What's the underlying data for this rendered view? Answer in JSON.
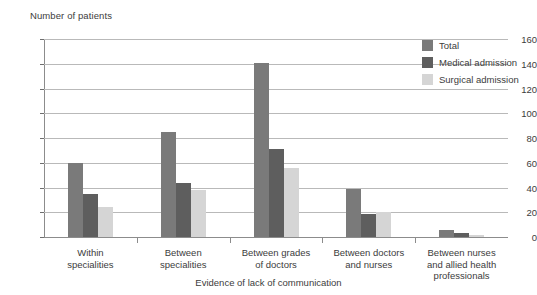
{
  "chart_data": {
    "type": "bar",
    "title": "Number of patients",
    "xlabel": "Evidence of lack of communication",
    "ylabel": "Number of patients",
    "ylim": [
      0,
      160
    ],
    "ytick_step": 20,
    "yticks": [
      0,
      20,
      40,
      60,
      80,
      100,
      120,
      140,
      160
    ],
    "grid": true,
    "legend_position": "top-right",
    "categories": [
      "Within specialities",
      "Between specialities",
      "Between grades of doctors",
      "Between doctors and nurses",
      "Between nurses and allied health professionals"
    ],
    "category_lines": [
      [
        "Within",
        "specialities"
      ],
      [
        "Between",
        "specialities"
      ],
      [
        "Between grades",
        "of doctors"
      ],
      [
        "Between doctors",
        "and nurses"
      ],
      [
        "Between nurses",
        "and allied health",
        "professionals"
      ]
    ],
    "series": [
      {
        "name": "Total",
        "color": "#7a7a7a",
        "values": [
          60,
          85,
          141,
          39,
          6
        ]
      },
      {
        "name": "Medical admission",
        "color": "#5e5e5e",
        "values": [
          35,
          44,
          71,
          19,
          3
        ]
      },
      {
        "name": "Surgical admission",
        "color": "#d5d5d5",
        "values": [
          24,
          38,
          56,
          20,
          2
        ]
      }
    ]
  },
  "colors": {
    "total": "#7a7a7a",
    "medical": "#5e5e5e",
    "surgical": "#d5d5d5",
    "gridline": "#b9b9b9",
    "axis": "#8c8c8c",
    "text": "#3c3c3c"
  }
}
